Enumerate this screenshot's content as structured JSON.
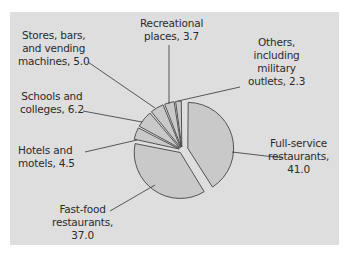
{
  "chart_data": {
    "type": "pie",
    "title": "",
    "unit": "percent",
    "exploded": [
      "Full-service restaurants"
    ],
    "slices": [
      {
        "label": "Full-service restaurants",
        "value": 41.0
      },
      {
        "label": "Fast-food restaurants",
        "value": 37.0
      },
      {
        "label": "Hotels and motels",
        "value": 4.5
      },
      {
        "label": "Schools and colleges",
        "value": 6.2
      },
      {
        "label": "Stores, bars, and vending machines",
        "value": 5.0
      },
      {
        "label": "Recreational places",
        "value": 3.7
      },
      {
        "label": "Others, including military outlets",
        "value": 2.3
      }
    ],
    "colors": {
      "panel": "#dedede",
      "slice_fill": "#c9c9c9",
      "stroke": "#444444"
    }
  },
  "labels": {
    "full_service": [
      "Full-service",
      "restaurants,",
      "41.0"
    ],
    "fast_food": [
      "Fast-food",
      "restaurants,",
      "37.0"
    ],
    "hotels": [
      "Hotels and",
      "motels, 4.5"
    ],
    "schools": [
      "Schools and",
      "colleges, 6.2"
    ],
    "stores": [
      "Stores, bars,",
      "and vending",
      "machines, 5.0"
    ],
    "recreational": [
      "Recreational",
      "places, 3.7"
    ],
    "others": [
      "Others,",
      "including",
      "military",
      "outlets, 2.3"
    ]
  }
}
